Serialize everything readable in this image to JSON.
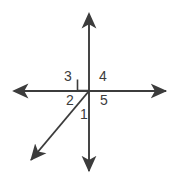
{
  "figure": {
    "type": "geometry-diagram",
    "background_color": "#ffffff",
    "stroke_color": "#3c3c3c",
    "label_color": "#3c3c3c"
  },
  "labels": {
    "angle_1": "1",
    "angle_2": "2",
    "angle_3": "3",
    "angle_4": "4",
    "angle_5": "5"
  },
  "elements": {
    "horizontal_line_name": "horizontal-line",
    "vertical_line_name": "vertical-line",
    "diagonal_ray_name": "diagonal-ray",
    "right_angle_marker_name": "right-angle-marker"
  },
  "geometry": {
    "intersection": {
      "x": 89,
      "y": 91
    },
    "horizontal_line": {
      "x1": 10,
      "y1": 91,
      "x2": 170,
      "y2": 91,
      "arrows": "both"
    },
    "vertical_line": {
      "x1": 89,
      "y1": 10,
      "x2": 89,
      "y2": 175,
      "arrows": "both"
    },
    "diagonal_ray": {
      "x1": 89,
      "y1": 91,
      "x2": 27,
      "y2": 165,
      "arrows": "end"
    },
    "right_angle_marker": {
      "x": 77,
      "y": 79,
      "size": 11,
      "quadrant": "upper-left"
    }
  }
}
